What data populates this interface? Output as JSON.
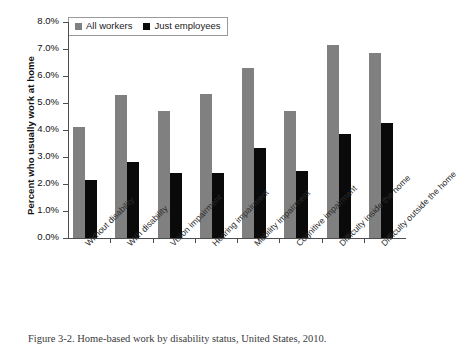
{
  "figure": {
    "caption": "Figure 3-2.  Home-based work by disability status, United States, 2010."
  },
  "legend": {
    "entries": [
      {
        "label": "All workers",
        "color": "#808080",
        "swatch": "gray-square-icon"
      },
      {
        "label": "Just employees",
        "color": "#0a0a0a",
        "swatch": "black-square-icon"
      }
    ]
  },
  "chart_data": {
    "type": "bar",
    "title": "",
    "xlabel": "",
    "ylabel": "Percent who usually work at home",
    "ylim": [
      0,
      8
    ],
    "ytick_labels": [
      "0.0%",
      "1.0%",
      "2.0%",
      "3.0%",
      "4.0%",
      "5.0%",
      "6.0%",
      "7.0%",
      "8.0%"
    ],
    "ytick_values": [
      0,
      1,
      2,
      3,
      4,
      5,
      6,
      7,
      8
    ],
    "grid": false,
    "legend_position": "top-left",
    "categories": [
      "Without disability",
      "With disability",
      "Vision impairment",
      "Hearing impairment",
      "Mobility impairment",
      "Cognitive impairment",
      "Difficulty inside the home",
      "Difficulty outside the home"
    ],
    "series": [
      {
        "name": "All workers",
        "color": "#808080",
        "values": [
          4.1,
          5.3,
          4.7,
          5.35,
          6.3,
          4.7,
          7.15,
          6.85
        ]
      },
      {
        "name": "Just employees",
        "color": "#0a0a0a",
        "values": [
          2.15,
          2.8,
          2.4,
          2.4,
          3.35,
          2.5,
          3.85,
          4.25
        ]
      }
    ]
  }
}
